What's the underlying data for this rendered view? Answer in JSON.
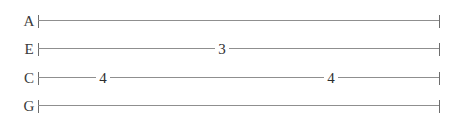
{
  "staff": {
    "instrument_tuning": [
      "A",
      "E",
      "C",
      "G"
    ],
    "line_color": "#8f8f8f",
    "barline_color": "#6e6e6e",
    "text_color": "#2e2e2e",
    "background_color": "#ffffff",
    "strings": [
      {
        "label": "A",
        "top": 9,
        "notes": []
      },
      {
        "label": "E",
        "top": 37,
        "notes": [
          {
            "fret": "3",
            "x": 222
          }
        ]
      },
      {
        "label": "C",
        "top": 66,
        "notes": [
          {
            "fret": "4",
            "x": 103
          },
          {
            "fret": "4",
            "x": 331
          }
        ]
      },
      {
        "label": "G",
        "top": 94,
        "notes": []
      }
    ]
  }
}
